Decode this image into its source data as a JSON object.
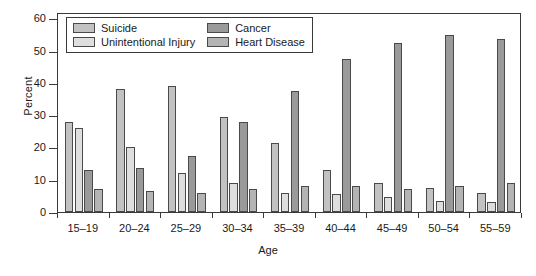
{
  "chart_data": {
    "type": "bar",
    "title": "",
    "xlabel": "Age",
    "ylabel": "Percent",
    "ylim": [
      0,
      62
    ],
    "yticks": [
      0,
      10,
      20,
      30,
      40,
      50,
      60
    ],
    "ytick_labels": [
      "0",
      "10",
      "20",
      "30",
      "40",
      "50",
      "60"
    ],
    "grid": false,
    "legend_position": "upper-left-inside",
    "categories": [
      "15–19",
      "20–24",
      "25–29",
      "30–34",
      "35–39",
      "40–44",
      "45–49",
      "50–54",
      "55–59"
    ],
    "series": [
      {
        "name": "Suicide",
        "color": "#c2c2c2",
        "values": [
          28.0,
          38.0,
          39.0,
          29.5,
          21.5,
          13.0,
          9.0,
          7.5,
          6.0
        ]
      },
      {
        "name": "Unintentional Injury",
        "color": "#dedede",
        "values": [
          26.0,
          20.0,
          12.0,
          9.0,
          6.0,
          5.5,
          4.5,
          3.5,
          3.0
        ]
      },
      {
        "name": "Cancer",
        "color": "#9a9a9a",
        "values": [
          13.0,
          13.5,
          17.5,
          28.0,
          37.5,
          47.5,
          52.5,
          55.0,
          53.5
        ]
      },
      {
        "name": "Heart Disease",
        "color": "#b4b4b4",
        "values": [
          7.0,
          6.5,
          6.0,
          7.0,
          8.0,
          8.0,
          7.0,
          8.0,
          9.0
        ]
      }
    ]
  },
  "legend": {
    "entries": [
      {
        "label": "Suicide"
      },
      {
        "label": "Cancer"
      },
      {
        "label": "Unintentional Injury"
      },
      {
        "label": "Heart Disease"
      }
    ]
  }
}
